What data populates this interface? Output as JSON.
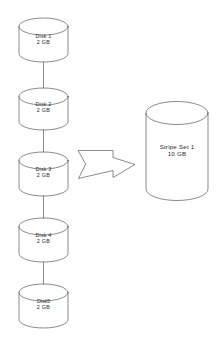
{
  "diagram": {
    "type": "disk-striping-diagram",
    "background_color": "#ffffff",
    "stroke_color": "#595959",
    "text_color": "#2b2b2b",
    "source_disks": [
      {
        "id": "disk-1",
        "name": "Disk 1",
        "capacity": "2 GB"
      },
      {
        "id": "disk-2",
        "name": "Disk 2",
        "capacity": "2 GB"
      },
      {
        "id": "disk-3",
        "name": "Disk 3",
        "capacity": "2 GB"
      },
      {
        "id": "disk-4",
        "name": "Disk 4",
        "capacity": "2 GB"
      },
      {
        "id": "disk-5",
        "name": "Disk5",
        "capacity": "2 GB"
      }
    ],
    "arrow": {
      "direction": "right",
      "style": "hollow-block-arrow"
    },
    "result": {
      "id": "stripe-set-1",
      "name": "Stripe Set 1",
      "capacity": "10 GB"
    }
  }
}
